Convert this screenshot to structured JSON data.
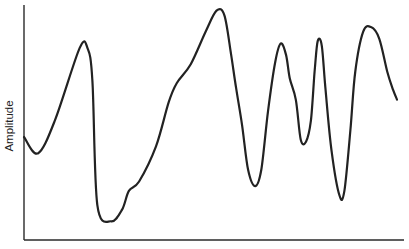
{
  "chart_data": {
    "type": "line",
    "title": "",
    "xlabel": "",
    "ylabel": "Amplitude",
    "xlim": [
      0,
      100
    ],
    "ylim": [
      0,
      100
    ],
    "grid": false,
    "legend": "none",
    "x_ticks": [],
    "y_ticks": [],
    "series": [
      {
        "name": "waveform",
        "color": "#222222",
        "x": [
          0,
          3.7,
          8.2,
          14.8,
          16.9,
          18.2,
          19.5,
          23.2,
          26.1,
          27.9,
          30.6,
          35.1,
          38.5,
          40.6,
          44.3,
          48.3,
          51.2,
          53.3,
          55.1,
          56.4,
          58.0,
          59.6,
          61.5,
          63.1,
          64.9,
          66.8,
          68.3,
          69.7,
          70.7,
          72.3,
          73.6,
          75.0,
          76.3,
          77.3,
          78.1,
          79.2,
          80.2,
          81.8,
          83.9,
          85.2,
          86.8,
          88.1,
          90.2,
          92.3,
          94.5,
          96.6,
          98.2,
          99.2
        ],
        "y": [
          44,
          37,
          51,
          82,
          82,
          68,
          15,
          8,
          13,
          21,
          25,
          40,
          59,
          67,
          75,
          89,
          98,
          96,
          79,
          65,
          49,
          30,
          23,
          30,
          55,
          76,
          84,
          79,
          69,
          60,
          43,
          42,
          51,
          72,
          85,
          83,
          64,
          38,
          19,
          21,
          47,
          72,
          89,
          91,
          86,
          72,
          64,
          60
        ]
      }
    ]
  }
}
